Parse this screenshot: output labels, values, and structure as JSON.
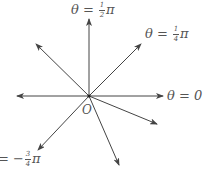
{
  "diagram": {
    "type": "polar-rays",
    "origin_label": "O",
    "stroke_color": "#444444",
    "labels": {
      "half_pi": {
        "theta": "θ",
        "eq": "=",
        "sign": "",
        "num": "1",
        "den": "2",
        "pi": "π"
      },
      "quarter_pi": {
        "theta": "θ",
        "eq": "=",
        "sign": "",
        "num": "1",
        "den": "4",
        "pi": "π"
      },
      "zero": {
        "theta": "θ",
        "eq": "=",
        "value": "0"
      },
      "neg_three_quarter_pi": {
        "eq": "=",
        "sign": "−",
        "num": "3",
        "den": "4",
        "pi": "π"
      }
    },
    "rays": [
      {
        "name": "ray-0",
        "angle": "0"
      },
      {
        "name": "ray-pi-over-4",
        "angle": "π/4"
      },
      {
        "name": "ray-pi-over-2",
        "angle": "π/2"
      },
      {
        "name": "ray-3pi-over-4",
        "angle": "3π/4"
      },
      {
        "name": "ray-pi",
        "angle": "π"
      },
      {
        "name": "ray-neg-3pi-over-4",
        "angle": "−3π/4"
      },
      {
        "name": "ray-steep-down",
        "angle": "≈ −3π/8"
      },
      {
        "name": "ray-shallow-down",
        "angle": "≈ −π/8"
      }
    ]
  }
}
